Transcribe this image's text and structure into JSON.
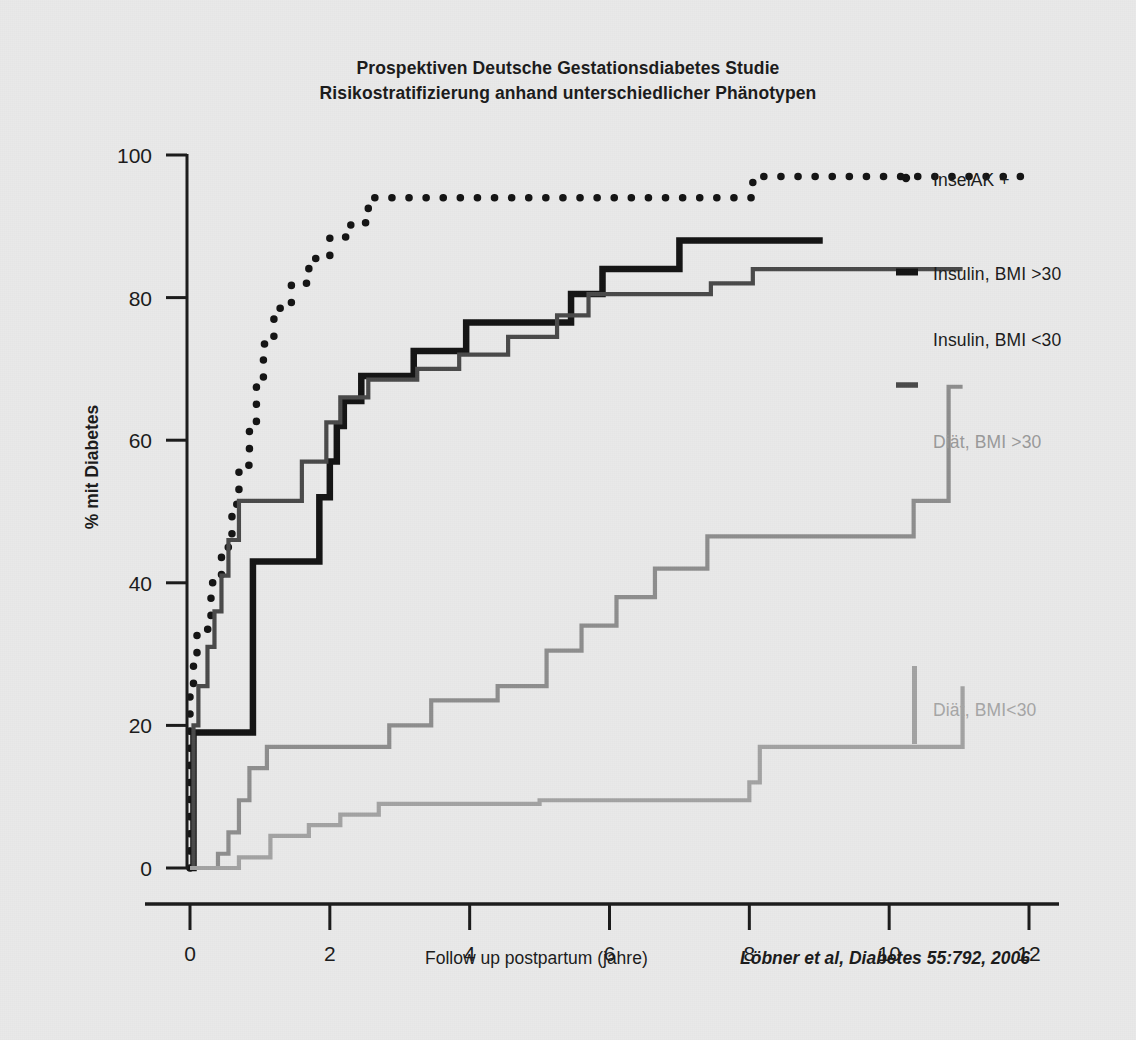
{
  "title": {
    "line1": "Prospektiven Deutsche Gestationsdiabetes Studie",
    "line2": "Risikostratifizierung anhand unterschiedlicher Phänotypen"
  },
  "citation": "Löbner et al, Diabetes 55:792, 2006",
  "axes": {
    "x_title": "Follow up postpartum (jahre)",
    "y_title": "% mit Diabetes",
    "x_ticks": [
      "0",
      "2",
      "4",
      "6",
      "8",
      "10",
      "12"
    ],
    "y_ticks": [
      "0",
      "20",
      "40",
      "60",
      "80",
      "100"
    ]
  },
  "series_labels": {
    "inselak": "InselAK +",
    "insulin_bmi_gt30": "Insulin, BMI >30",
    "insulin_bmi_lt30": "Insulin, BMI <30",
    "diaet_bmi_gt30": "Diät, BMI >30",
    "diaet_bmi_lt30": "Diät, BMI<30"
  },
  "colors": {
    "background": "#e9e9e9",
    "inselak": "#141414",
    "insulin_bmi_gt30": "#141414",
    "insulin_bmi_lt30": "#4a4a4a",
    "diaet_bmi_gt30": "#8e8e8e",
    "diaet_bmi_lt30": "#a3a3a3",
    "axis": "#1b1b1b"
  },
  "chart_data": {
    "type": "line",
    "subtitle": "Kaplan-Meier cumulative incidence of diabetes after gestational diabetes",
    "xlabel": "Follow up postpartum (jahre)",
    "ylabel": "% mit Diabetes",
    "xlim": [
      -0.35,
      12.6
    ],
    "ylim": [
      0,
      100
    ],
    "grid": false,
    "legend_position": "right-inline",
    "x_ticks": [
      0,
      2,
      4,
      6,
      8,
      10,
      12
    ],
    "y_ticks": [
      0,
      20,
      40,
      60,
      80,
      100
    ],
    "step_type": "post",
    "series": [
      {
        "name": "InselAK +",
        "style": "dotted",
        "color": "#141414",
        "points": [
          [
            0.0,
            0.0
          ],
          [
            0.0,
            24.0
          ],
          [
            0.05,
            29.0
          ],
          [
            0.1,
            33.5
          ],
          [
            0.3,
            40.0
          ],
          [
            0.45,
            45.0
          ],
          [
            0.6,
            51.0
          ],
          [
            0.7,
            56.5
          ],
          [
            0.85,
            62.0
          ],
          [
            0.95,
            68.0
          ],
          [
            1.05,
            73.5
          ],
          [
            1.2,
            78.5
          ],
          [
            1.45,
            82.0
          ],
          [
            1.7,
            85.5
          ],
          [
            2.0,
            88.5
          ],
          [
            2.3,
            90.5
          ],
          [
            2.55,
            94.0
          ],
          [
            8.0,
            94.0
          ],
          [
            8.05,
            97.0
          ],
          [
            12.0,
            97.0
          ]
        ]
      },
      {
        "name": "Insulin, BMI >30",
        "style": "solid-thick",
        "color": "#141414",
        "points": [
          [
            0.0,
            0.0
          ],
          [
            0.05,
            19.0
          ],
          [
            0.85,
            19.0
          ],
          [
            0.9,
            43.0
          ],
          [
            1.75,
            43.0
          ],
          [
            1.85,
            52.0
          ],
          [
            2.0,
            57.0
          ],
          [
            2.1,
            62.0
          ],
          [
            2.2,
            65.5
          ],
          [
            2.35,
            65.5
          ],
          [
            2.45,
            69.0
          ],
          [
            3.05,
            69.0
          ],
          [
            3.2,
            72.5
          ],
          [
            3.85,
            72.5
          ],
          [
            3.95,
            76.5
          ],
          [
            5.3,
            76.5
          ],
          [
            5.45,
            80.5
          ],
          [
            5.75,
            80.5
          ],
          [
            5.9,
            84.0
          ],
          [
            6.85,
            84.0
          ],
          [
            7.0,
            88.0
          ],
          [
            9.05,
            88.0
          ]
        ]
      },
      {
        "name": "Insulin, BMI <30",
        "style": "solid-medium",
        "color": "#4a4a4a",
        "points": [
          [
            0.0,
            0.0
          ],
          [
            0.05,
            20.0
          ],
          [
            0.12,
            25.5
          ],
          [
            0.25,
            31.0
          ],
          [
            0.35,
            36.0
          ],
          [
            0.45,
            41.0
          ],
          [
            0.55,
            46.0
          ],
          [
            0.7,
            51.5
          ],
          [
            1.45,
            51.5
          ],
          [
            1.6,
            57.0
          ],
          [
            1.95,
            62.5
          ],
          [
            2.15,
            66.0
          ],
          [
            2.45,
            66.0
          ],
          [
            2.55,
            68.5
          ],
          [
            3.1,
            68.5
          ],
          [
            3.25,
            70.0
          ],
          [
            3.7,
            70.0
          ],
          [
            3.85,
            72.0
          ],
          [
            4.4,
            72.0
          ],
          [
            4.55,
            74.5
          ],
          [
            5.1,
            74.5
          ],
          [
            5.25,
            77.5
          ],
          [
            5.55,
            77.5
          ],
          [
            5.7,
            80.5
          ],
          [
            7.3,
            80.5
          ],
          [
            7.45,
            82.0
          ],
          [
            7.9,
            82.0
          ],
          [
            8.05,
            84.0
          ],
          [
            11.05,
            84.0
          ]
        ]
      },
      {
        "name": "Diät, BMI >30",
        "style": "solid-medium",
        "color": "#8e8e8e",
        "points": [
          [
            0.0,
            0.0
          ],
          [
            0.3,
            0.0
          ],
          [
            0.4,
            2.0
          ],
          [
            0.55,
            5.0
          ],
          [
            0.7,
            9.5
          ],
          [
            0.85,
            14.0
          ],
          [
            1.1,
            17.0
          ],
          [
            2.7,
            17.0
          ],
          [
            2.85,
            20.0
          ],
          [
            3.3,
            20.0
          ],
          [
            3.45,
            23.5
          ],
          [
            4.25,
            23.5
          ],
          [
            4.4,
            25.5
          ],
          [
            4.95,
            25.5
          ],
          [
            5.1,
            30.5
          ],
          [
            5.45,
            30.5
          ],
          [
            5.6,
            34.0
          ],
          [
            5.95,
            34.0
          ],
          [
            6.1,
            38.0
          ],
          [
            6.5,
            38.0
          ],
          [
            6.65,
            42.0
          ],
          [
            7.25,
            42.0
          ],
          [
            7.4,
            46.5
          ],
          [
            10.2,
            46.5
          ],
          [
            10.35,
            51.5
          ],
          [
            10.75,
            51.5
          ],
          [
            10.85,
            67.5
          ],
          [
            11.05,
            67.5
          ]
        ]
      },
      {
        "name": "Diät, BMI<30",
        "style": "solid-medium",
        "color": "#a3a3a3",
        "points": [
          [
            0.0,
            0.0
          ],
          [
            0.55,
            0.0
          ],
          [
            0.7,
            1.5
          ],
          [
            1.0,
            1.5
          ],
          [
            1.15,
            4.5
          ],
          [
            1.55,
            4.5
          ],
          [
            1.7,
            6.0
          ],
          [
            2.0,
            6.0
          ],
          [
            2.15,
            7.5
          ],
          [
            2.55,
            7.5
          ],
          [
            2.7,
            9.0
          ],
          [
            4.85,
            9.0
          ],
          [
            5.0,
            9.5
          ],
          [
            7.85,
            9.5
          ],
          [
            8.0,
            12.0
          ],
          [
            8.15,
            17.0
          ],
          [
            10.95,
            17.0
          ],
          [
            11.05,
            25.5
          ]
        ]
      }
    ]
  }
}
